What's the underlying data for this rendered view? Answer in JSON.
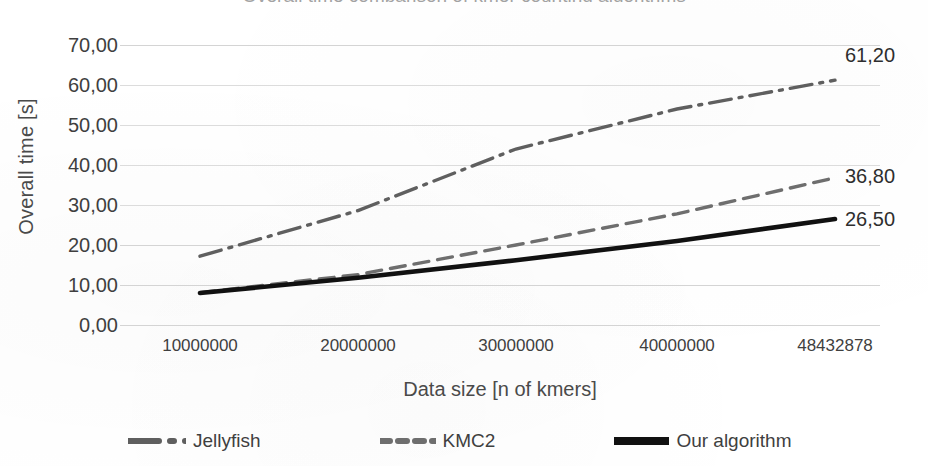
{
  "chart_data": {
    "type": "line",
    "title": "Overall time comparison of kmer counting algorithms",
    "xlabel": "Data size [n of kmers]",
    "ylabel": "Overall time [s]",
    "x_tick_labels": [
      "10000000",
      "20000000",
      "30000000",
      "40000000",
      "48432878"
    ],
    "x": [
      10000000,
      20000000,
      30000000,
      40000000,
      48432878
    ],
    "y_tick_labels": [
      "70,00",
      "60,00",
      "50,00",
      "40,00",
      "30,00",
      "20,00",
      "10,00",
      "0,00"
    ],
    "ylim": [
      0,
      70
    ],
    "ytick_step": 10,
    "grid": true,
    "legend_position": "bottom",
    "series": [
      {
        "name": "Jellyfish",
        "style": "dash-dot",
        "color": "#5f5f5f",
        "width": 3,
        "values": [
          17.2,
          28.6,
          44.0,
          54.0,
          61.2
        ],
        "end_label": "61,20"
      },
      {
        "name": "KMC2",
        "style": "dashed",
        "color": "#6e6e6e",
        "width": 3,
        "values": [
          8.1,
          12.6,
          20.0,
          27.8,
          36.8
        ],
        "end_label": "36,80"
      },
      {
        "name": "Our algorithm",
        "style": "solid",
        "color": "#111111",
        "width": 4,
        "values": [
          8.0,
          11.8,
          16.2,
          21.0,
          26.5
        ],
        "end_label": "26,50"
      }
    ],
    "data_labels": [
      "61,20",
      "36,80",
      "26,50"
    ]
  },
  "legend": {
    "items": [
      {
        "label": "Jellyfish",
        "key": "dash-dot-line-key"
      },
      {
        "label": "KMC2",
        "key": "dashed-line-key"
      },
      {
        "label": "Our algorithm",
        "key": "solid-line-key"
      }
    ]
  }
}
